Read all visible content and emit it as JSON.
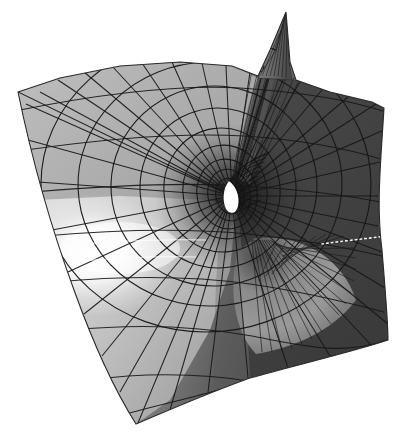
{
  "figure": {
    "title": "Minimal surface with spiral singularity",
    "domain": "Natural-Image",
    "width": 420,
    "height": 431,
    "background_color": "#ffffff",
    "render_style": "grayscale shaded 3D wireframe"
  },
  "palette": {
    "white": "#ffffff",
    "highlight": "#fdfdfd",
    "light_gray": "#d8d8d8",
    "mid_light_gray": "#b4b4b4",
    "mid_gray": "#9a9a9a",
    "mid_dark_gray": "#777777",
    "dark_gray": "#4e4e4e",
    "darker_gray": "#3c3c3c",
    "deep_gray": "#2e2e2e",
    "wire_color": "#1a1a1a"
  },
  "geometry": {
    "center": {
      "x": 232,
      "y": 196
    },
    "hole": {
      "name": "central-white-hole",
      "color": "#ffffff",
      "center": {
        "x": 231,
        "y": 196
      },
      "approx_width": 18,
      "approx_height": 30
    },
    "spike": {
      "name": "top-spike",
      "apex": {
        "x": 286,
        "y": 12
      },
      "base_left": {
        "x": 262,
        "y": 80
      },
      "base_right": {
        "x": 292,
        "y": 78
      }
    },
    "fan_lower_right": {
      "name": "lower-right-radial-fan",
      "focus": {
        "x": 255,
        "y": 238
      },
      "radius": 95,
      "ray_count": 34
    },
    "specular_highlight": {
      "name": "left-specular-highlight",
      "center": {
        "x": 95,
        "y": 255
      },
      "radius": 78,
      "color": "#ffffff"
    },
    "dotted_fold_highlight": {
      "name": "right-fold-dotted-highlight",
      "from": {
        "x": 325,
        "y": 243
      },
      "to": {
        "x": 386,
        "y": 237
      },
      "color": "#e8e8e8"
    },
    "outline_points": [
      [
        18,
        92
      ],
      [
        60,
        78
      ],
      [
        120,
        66
      ],
      [
        180,
        62
      ],
      [
        232,
        66
      ],
      [
        258,
        76
      ],
      [
        270,
        50
      ],
      [
        286,
        12
      ],
      [
        290,
        62
      ],
      [
        296,
        80
      ],
      [
        330,
        92
      ],
      [
        372,
        102
      ],
      [
        384,
        108
      ],
      [
        380,
        160
      ],
      [
        376,
        210
      ],
      [
        382,
        250
      ],
      [
        386,
        300
      ],
      [
        388,
        340
      ],
      [
        352,
        352
      ],
      [
        300,
        364
      ],
      [
        250,
        378
      ],
      [
        200,
        396
      ],
      [
        160,
        414
      ],
      [
        136,
        424
      ],
      [
        112,
        386
      ],
      [
        92,
        340
      ],
      [
        74,
        290
      ],
      [
        52,
        230
      ],
      [
        32,
        160
      ],
      [
        18,
        92
      ]
    ],
    "mesh": {
      "radial_line_count": 44,
      "spiral_ring_count": 9,
      "arc_family_count": 4
    }
  },
  "labels": {
    "figure_label": "",
    "axis_labels": [],
    "legend": []
  }
}
